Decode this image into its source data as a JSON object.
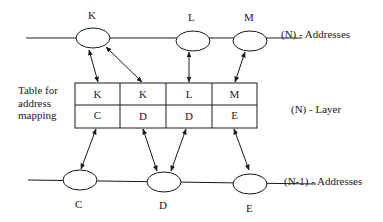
{
  "diagram": {
    "top_layer": {
      "label": "(N) - Addresses",
      "nodes": [
        {
          "id": "K",
          "label": "K"
        },
        {
          "id": "L",
          "label": "L"
        },
        {
          "id": "M",
          "label": "M"
        }
      ]
    },
    "middle": {
      "table_caption_lines": [
        "Table for",
        "address",
        "mapping"
      ],
      "layer_label": "(N) -  Layer",
      "table": {
        "top_row": [
          "K",
          "K",
          "L",
          "M"
        ],
        "bottom_row": [
          "C",
          "D",
          "D",
          "E"
        ]
      }
    },
    "bottom_layer": {
      "label": "(N-1) - Addresses",
      "nodes": [
        {
          "id": "C",
          "label": "C"
        },
        {
          "id": "D",
          "label": "D"
        },
        {
          "id": "E",
          "label": "E"
        }
      ]
    },
    "colors": {
      "stroke": "#1a1a1a",
      "background": "#ffffff"
    }
  }
}
